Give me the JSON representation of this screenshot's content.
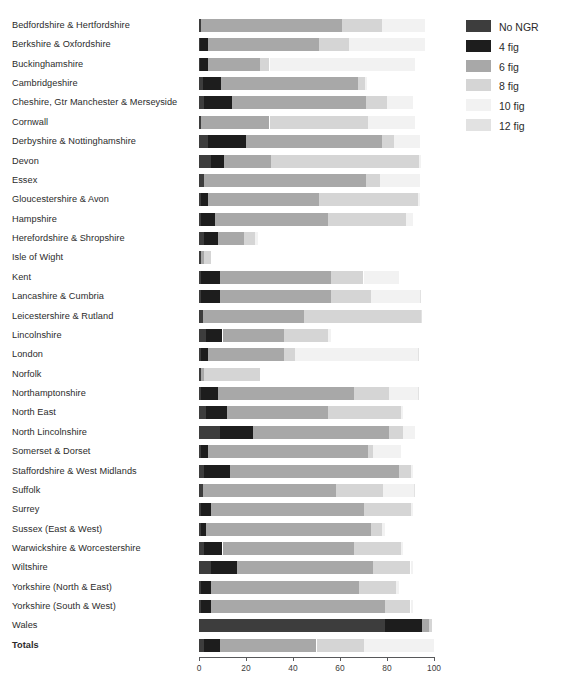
{
  "figure": {
    "top_fragment": "",
    "axis": {
      "ticks": [
        0,
        20,
        40,
        60,
        80,
        100
      ],
      "min": 0,
      "max": 100,
      "tick_labels": [
        "0",
        "20",
        "40",
        "60",
        "80",
        "100"
      ]
    }
  },
  "legend": {
    "position": "right",
    "items": [
      {
        "label": "No NGR",
        "color": "#3d3d3d"
      },
      {
        "label": "4 fig",
        "color": "#1d1d1d"
      },
      {
        "label": "6 fig",
        "color": "#a8a8a8"
      },
      {
        "label": "8 fig",
        "color": "#d5d5d5"
      },
      {
        "label": "10 fig",
        "color": "#f2f2f2"
      },
      {
        "label": "12 fig",
        "color": "#e2e2e2"
      }
    ]
  },
  "chart_data": {
    "type": "bar",
    "orientation": "horizontal",
    "stacked": true,
    "title": "",
    "xlabel": "",
    "ylabel": "",
    "xlim": [
      0,
      100
    ],
    "grid": false,
    "legend_position": "right",
    "series_names": [
      "No NGR",
      "4 fig",
      "6 fig",
      "8 fig",
      "10 fig",
      "12 fig"
    ],
    "series_colors": [
      "#3d3d3d",
      "#1d1d1d",
      "#a8a8a8",
      "#d5d5d5",
      "#f2f2f2",
      "#e2e2e2"
    ],
    "categories": [
      "Bedfordshire & Hertfordshire",
      "Berkshire & Oxfordshire",
      "Buckinghamshire",
      "Cambridgeshire",
      "Cheshire, Gtr Manchester & Merseyside",
      "Cornwall",
      "Derbyshire & Nottinghamshire",
      "Devon",
      "Essex",
      "Gloucestershire & Avon",
      "Hampshire",
      "Herefordshire & Shropshire",
      "Isle of Wight",
      "Kent",
      "Lancashire & Cumbria",
      "Leicestershire & Rutland",
      "Lincolnshire",
      "London",
      "Norfolk",
      "Northamptonshire",
      "North East",
      "North Lincolnshire",
      "Somerset & Dorset",
      "Staffordshire & West Midlands",
      "Suffolk",
      "Surrey",
      "Sussex (East & West)",
      "Warwickshire & Worcestershire",
      "Wiltshire",
      "Yorkshire (North & East)",
      "Yorkshire (South & West)",
      "Wales",
      "Totals"
    ],
    "bold_categories": [
      "Totals"
    ],
    "values": [
      {
        "category": "Bedfordshire & Hertfordshire",
        "No NGR": 1.0,
        "4 fig": 0.0,
        "6 fig": 60.0,
        "8 fig": 17.0,
        "10 fig": 18.0,
        "12 fig": 0.0
      },
      {
        "category": "Berkshire & Oxfordshire",
        "No NGR": 0.5,
        "4 fig": 3.5,
        "6 fig": 47.0,
        "8 fig": 13.0,
        "10 fig": 32.0,
        "12 fig": 0.0
      },
      {
        "category": "Buckinghamshire",
        "No NGR": 0.5,
        "4 fig": 3.5,
        "6 fig": 22.0,
        "8 fig": 4.0,
        "10 fig": 62.0,
        "12 fig": 0.0
      },
      {
        "category": "Cambridgeshire",
        "No NGR": 1.5,
        "4 fig": 8.0,
        "6 fig": 58.0,
        "8 fig": 3.0,
        "10 fig": 1.0,
        "12 fig": 0.0
      },
      {
        "category": "Cheshire, Gtr Manchester & Merseyside",
        "No NGR": 2.0,
        "4 fig": 12.0,
        "6 fig": 57.0,
        "8 fig": 9.0,
        "10 fig": 11.0,
        "12 fig": 0.0
      },
      {
        "category": "Cornwall",
        "No NGR": 1.0,
        "4 fig": 0.0,
        "6 fig": 29.0,
        "8 fig": 42.0,
        "10 fig": 20.0,
        "12 fig": 0.0
      },
      {
        "category": "Derbyshire & Nottinghamshire",
        "No NGR": 4.0,
        "4 fig": 16.0,
        "6 fig": 58.0,
        "8 fig": 5.0,
        "10 fig": 11.0,
        "12 fig": 0.0
      },
      {
        "category": "Devon",
        "No NGR": 5.0,
        "4 fig": 5.5,
        "6 fig": 20.0,
        "8 fig": 63.0,
        "10 fig": 1.0,
        "12 fig": 0.0
      },
      {
        "category": "Essex",
        "No NGR": 2.0,
        "4 fig": 0.0,
        "6 fig": 69.0,
        "8 fig": 6.0,
        "10 fig": 17.0,
        "12 fig": 0.0
      },
      {
        "category": "Gloucestershire & Avon",
        "No NGR": 1.0,
        "4 fig": 3.0,
        "6 fig": 47.0,
        "8 fig": 42.0,
        "10 fig": 1.0,
        "12 fig": 0.0
      },
      {
        "category": "Hampshire",
        "No NGR": 1.0,
        "4 fig": 6.0,
        "6 fig": 48.0,
        "8 fig": 33.0,
        "10 fig": 3.0,
        "12 fig": 0.0
      },
      {
        "category": "Herefordshire & Shropshire",
        "No NGR": 2.0,
        "4 fig": 6.0,
        "6 fig": 11.0,
        "8 fig": 5.0,
        "10 fig": 1.0,
        "12 fig": 0.0
      },
      {
        "category": "Isle of Wight",
        "No NGR": 1.0,
        "4 fig": 0.0,
        "6 fig": 1.0,
        "8 fig": 3.0,
        "10 fig": 0.0,
        "12 fig": 0.0
      },
      {
        "category": "Kent",
        "No NGR": 1.0,
        "4 fig": 8.0,
        "6 fig": 47.0,
        "8 fig": 14.0,
        "10 fig": 15.0,
        "12 fig": 0.0
      },
      {
        "category": "Lancashire & Cumbria",
        "No NGR": 1.0,
        "4 fig": 8.0,
        "6 fig": 47.0,
        "8 fig": 17.0,
        "10 fig": 21.0,
        "12 fig": 0.5
      },
      {
        "category": "Leicestershire & Rutland",
        "No NGR": 1.5,
        "4 fig": 0.0,
        "6 fig": 43.0,
        "8 fig": 50.0,
        "10 fig": 0.0,
        "12 fig": 0.5
      },
      {
        "category": "Lincolnshire",
        "No NGR": 3.0,
        "4 fig": 7.0,
        "6 fig": 26.0,
        "8 fig": 19.0,
        "10 fig": 1.0,
        "12 fig": 0.0
      },
      {
        "category": "London",
        "No NGR": 1.0,
        "4 fig": 3.0,
        "6 fig": 32.0,
        "8 fig": 5.0,
        "10 fig": 52.0,
        "12 fig": 0.5
      },
      {
        "category": "Norfolk",
        "No NGR": 1.0,
        "4 fig": 0.0,
        "6 fig": 1.0,
        "8 fig": 24.0,
        "10 fig": 0.0,
        "12 fig": 0.0
      },
      {
        "category": "Northamptonshire",
        "No NGR": 1.0,
        "4 fig": 7.0,
        "6 fig": 58.0,
        "8 fig": 15.0,
        "10 fig": 12.0,
        "12 fig": 0.5
      },
      {
        "category": "North East",
        "No NGR": 3.0,
        "4 fig": 9.0,
        "6 fig": 43.0,
        "8 fig": 31.0,
        "10 fig": 1.0,
        "12 fig": 0.0
      },
      {
        "category": "North Lincolnshire",
        "No NGR": 9.0,
        "4 fig": 14.0,
        "6 fig": 58.0,
        "8 fig": 6.0,
        "10 fig": 5.0,
        "12 fig": 0.0
      },
      {
        "category": "Somerset & Dorset",
        "No NGR": 1.0,
        "4 fig": 3.0,
        "6 fig": 68.0,
        "8 fig": 2.0,
        "10 fig": 12.0,
        "12 fig": 0.0
      },
      {
        "category": "Staffordshire & West Midlands",
        "No NGR": 2.0,
        "4 fig": 11.0,
        "6 fig": 72.0,
        "8 fig": 5.0,
        "10 fig": 1.0,
        "12 fig": 0.0
      },
      {
        "category": "Suffolk",
        "No NGR": 1.5,
        "4 fig": 0.0,
        "6 fig": 57.0,
        "8 fig": 20.0,
        "10 fig": 13.0,
        "12 fig": 0.5
      },
      {
        "category": "Surrey",
        "No NGR": 1.0,
        "4 fig": 4.0,
        "6 fig": 65.0,
        "8 fig": 20.0,
        "10 fig": 1.0,
        "12 fig": 0.0
      },
      {
        "category": "Sussex (East & West)",
        "No NGR": 1.0,
        "4 fig": 2.0,
        "6 fig": 70.0,
        "8 fig": 5.0,
        "10 fig": 1.0,
        "12 fig": 0.0
      },
      {
        "category": "Warwickshire & Worcestershire",
        "No NGR": 2.0,
        "4 fig": 8.0,
        "6 fig": 56.0,
        "8 fig": 20.0,
        "10 fig": 1.0,
        "12 fig": 0.0
      },
      {
        "category": "Wiltshire",
        "No NGR": 5.0,
        "4 fig": 11.0,
        "6 fig": 58.0,
        "8 fig": 16.0,
        "10 fig": 1.0,
        "12 fig": 0.0
      },
      {
        "category": "Yorkshire (North & East)",
        "No NGR": 1.0,
        "4 fig": 4.0,
        "6 fig": 63.0,
        "8 fig": 16.0,
        "10 fig": 1.0,
        "12 fig": 0.0
      },
      {
        "category": "Yorkshire (South & West)",
        "No NGR": 1.0,
        "4 fig": 4.0,
        "6 fig": 74.0,
        "8 fig": 11.0,
        "10 fig": 1.0,
        "12 fig": 0.0
      },
      {
        "category": "Wales",
        "No NGR": 79.0,
        "4 fig": 16.0,
        "6 fig": 3.0,
        "8 fig": 1.0,
        "10 fig": 0.0,
        "12 fig": 0.0
      },
      {
        "category": "Totals",
        "No NGR": 2.0,
        "4 fig": 7.0,
        "6 fig": 41.0,
        "8 fig": 20.0,
        "10 fig": 30.0,
        "12 fig": 0.0
      }
    ]
  }
}
